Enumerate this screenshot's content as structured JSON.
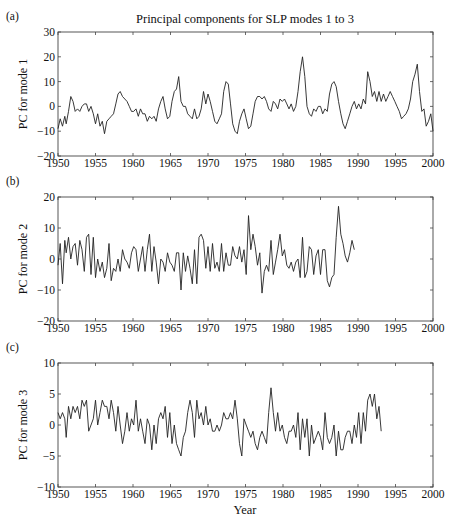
{
  "figure": {
    "title": "Principal components for SLP modes 1 to 3",
    "xlabel": "Year"
  },
  "chart_data": [
    {
      "type": "line",
      "panel_label": "(a)",
      "title": "Principal components for SLP modes 1 to 3",
      "xlabel": "",
      "ylabel": "PC for mode 1",
      "xlim": [
        1950,
        2000
      ],
      "ylim": [
        -20,
        30
      ],
      "xticks": [
        1950,
        1955,
        1960,
        1965,
        1970,
        1975,
        1980,
        1985,
        1990,
        1995,
        2000
      ],
      "yticks": [
        -20,
        -10,
        0,
        10,
        20,
        30
      ],
      "grid": false,
      "series": [
        {
          "name": "PC1",
          "x": [
            1950.0,
            1950.3,
            1950.6,
            1950.9,
            1951.1,
            1951.4,
            1951.7,
            1952.0,
            1952.3,
            1952.6,
            1952.9,
            1953.2,
            1953.5,
            1953.8,
            1954.1,
            1954.4,
            1954.7,
            1955.0,
            1955.3,
            1955.6,
            1955.9,
            1956.2,
            1956.5,
            1956.8,
            1957.1,
            1957.4,
            1957.7,
            1958.0,
            1958.3,
            1958.6,
            1958.9,
            1959.2,
            1959.5,
            1959.8,
            1960.1,
            1960.4,
            1960.7,
            1961.0,
            1961.3,
            1961.6,
            1961.9,
            1962.2,
            1962.5,
            1962.8,
            1963.1,
            1963.4,
            1963.7,
            1964.0,
            1964.3,
            1964.6,
            1964.9,
            1965.2,
            1965.5,
            1965.8,
            1966.1,
            1966.4,
            1966.7,
            1967.0,
            1967.3,
            1967.6,
            1967.9,
            1968.2,
            1968.5,
            1968.8,
            1969.1,
            1969.4,
            1969.7,
            1970.0,
            1970.3,
            1970.6,
            1970.9,
            1971.2,
            1971.5,
            1971.8,
            1972.1,
            1972.4,
            1972.7,
            1973.0,
            1973.3,
            1973.6,
            1973.9,
            1974.2,
            1974.5,
            1974.8,
            1975.1,
            1975.4,
            1975.7,
            1976.0,
            1976.3,
            1976.6,
            1976.9,
            1977.2,
            1977.5,
            1977.8,
            1978.1,
            1978.4,
            1978.7,
            1979.0,
            1979.3,
            1979.6,
            1979.9,
            1980.2,
            1980.5,
            1980.8,
            1981.1,
            1981.4,
            1981.7,
            1982.0,
            1982.3,
            1982.6,
            1982.9,
            1983.2,
            1983.5,
            1983.8,
            1984.1,
            1984.4,
            1984.7,
            1985.0,
            1985.3,
            1985.6,
            1985.9,
            1986.2,
            1986.5,
            1986.8,
            1987.1,
            1987.4,
            1987.7,
            1988.0,
            1988.3,
            1988.6,
            1988.9,
            1989.2,
            1989.5,
            1989.8,
            1990.1,
            1990.4,
            1990.7,
            1991.0,
            1991.3,
            1991.6,
            1991.9,
            1992.2,
            1992.5,
            1992.8,
            1993.1,
            1993.4,
            1993.7,
            1994.0,
            1994.3,
            1994.6,
            1994.9,
            1995.2,
            1995.5,
            1995.8,
            1996.1,
            1996.4,
            1996.7,
            1997.0,
            1997.3,
            1997.6,
            1997.9,
            1998.2,
            1998.5,
            1998.8,
            1999.1,
            1999.4,
            1999.7,
            2000.0
          ],
          "values": [
            -9,
            -5,
            -8,
            -4,
            -7,
            -2,
            4,
            2,
            -2,
            -1,
            -2,
            0,
            1,
            1,
            -2,
            0,
            -3,
            -7,
            -3,
            -8,
            -6,
            -11,
            -6,
            -5,
            -4,
            -3,
            1,
            5,
            6,
            4,
            3,
            2,
            0,
            -2,
            -2,
            -1,
            -4,
            -1,
            -3,
            -3,
            -6,
            -4,
            -5,
            -4,
            -6,
            -1,
            2,
            4,
            -1,
            -5,
            -4,
            2,
            6,
            7,
            12,
            2,
            0,
            0,
            -3,
            -4,
            -5,
            -1,
            -5,
            -4,
            -1,
            6,
            1,
            5,
            2,
            -2,
            -6,
            -7,
            -5,
            -3,
            6,
            10,
            9,
            1,
            -7,
            -10,
            -11,
            -6,
            -3,
            -1,
            -5,
            -9,
            -8,
            -3,
            2,
            4,
            4,
            3,
            4,
            2,
            -1,
            -2,
            2,
            1,
            -1,
            3,
            2,
            3,
            1,
            -1,
            1,
            -2,
            0,
            6,
            14,
            20,
            12,
            0,
            -3,
            -4,
            -1,
            -2,
            0,
            0,
            -3,
            -1,
            -2,
            5,
            9,
            10,
            8,
            2,
            -3,
            -7,
            -9,
            -6,
            -3,
            0,
            2,
            -1,
            1,
            -1,
            3,
            1,
            14,
            10,
            4,
            6,
            2,
            6,
            2,
            5,
            2,
            4,
            6,
            4,
            2,
            0,
            -2,
            -5,
            -4,
            -3,
            -1,
            3,
            10,
            13,
            17,
            6,
            -2,
            -1,
            -8,
            -6,
            -3,
            -10
          ]
        }
      ]
    },
    {
      "type": "line",
      "panel_label": "(b)",
      "title": "",
      "xlabel": "",
      "ylabel": "PC for mode 2",
      "xlim": [
        1950,
        2000
      ],
      "ylim": [
        -20,
        20
      ],
      "xticks": [
        1950,
        1955,
        1960,
        1965,
        1970,
        1975,
        1980,
        1985,
        1990,
        1995,
        2000
      ],
      "yticks": [
        -20,
        -10,
        0,
        10,
        20
      ],
      "grid": false,
      "series": [
        {
          "name": "PC2",
          "x": [
            1950.0,
            1950.3,
            1950.6,
            1950.9,
            1951.1,
            1951.4,
            1951.7,
            1952.0,
            1952.3,
            1952.6,
            1952.9,
            1953.2,
            1953.5,
            1953.8,
            1954.1,
            1954.4,
            1954.7,
            1955.0,
            1955.3,
            1955.6,
            1955.9,
            1956.2,
            1956.5,
            1956.8,
            1957.1,
            1957.4,
            1957.7,
            1958.0,
            1958.3,
            1958.6,
            1958.9,
            1959.2,
            1959.5,
            1959.8,
            1960.1,
            1960.4,
            1960.7,
            1961.0,
            1961.3,
            1961.6,
            1961.9,
            1962.2,
            1962.5,
            1962.8,
            1963.1,
            1963.4,
            1963.7,
            1964.0,
            1964.3,
            1964.6,
            1964.9,
            1965.2,
            1965.5,
            1965.8,
            1966.1,
            1966.4,
            1966.7,
            1967.0,
            1967.3,
            1967.6,
            1967.9,
            1968.2,
            1968.5,
            1968.8,
            1969.1,
            1969.4,
            1969.7,
            1970.0,
            1970.3,
            1970.6,
            1970.9,
            1971.2,
            1971.5,
            1971.8,
            1972.1,
            1972.4,
            1972.7,
            1973.0,
            1973.3,
            1973.6,
            1973.9,
            1974.2,
            1974.5,
            1974.8,
            1975.1,
            1975.4,
            1975.7,
            1976.0,
            1976.3,
            1976.6,
            1976.9,
            1977.2,
            1977.5,
            1977.8,
            1978.1,
            1978.4,
            1978.7,
            1979.0,
            1979.3,
            1979.6,
            1979.9,
            1980.2,
            1980.5,
            1980.8,
            1981.1,
            1981.4,
            1981.7,
            1982.0,
            1982.3,
            1982.6,
            1982.9,
            1983.2,
            1983.5,
            1983.8,
            1984.1,
            1984.4,
            1984.7,
            1985.0,
            1985.3,
            1985.6,
            1985.9,
            1986.2,
            1986.5,
            1986.8,
            1987.1,
            1987.4,
            1987.7,
            1988.0,
            1988.3,
            1988.6,
            1988.9,
            1989.2,
            1989.5,
            1989.8,
            1990.1,
            1990.4,
            1990.7,
            1991.0,
            1991.3,
            1991.6,
            1991.9,
            1992.2,
            1992.5,
            1992.8,
            1993.1,
            1993.4,
            1993.7,
            1994.0,
            1994.3,
            1994.6,
            1994.9,
            1995.2,
            1995.5,
            1995.8,
            1996.1,
            1996.4,
            1996.7,
            1997.0,
            1997.3,
            1997.6,
            1997.9,
            1998.2,
            1998.5,
            1998.8,
            1999.1,
            1999.4,
            1999.7,
            2000.0
          ],
          "values": [
            -2,
            5,
            -8,
            6,
            2,
            7,
            0,
            4,
            5,
            -2,
            6,
            3,
            -4,
            7,
            8,
            -5,
            7,
            -6,
            0,
            -4,
            -1,
            -6,
            -3,
            5,
            -7,
            -3,
            -4,
            0,
            -4,
            3,
            0,
            -1,
            -3,
            2,
            4,
            3,
            -4,
            0,
            4,
            -4,
            3,
            8,
            -4,
            4,
            -1,
            -8,
            0,
            -1,
            -4,
            2,
            -1,
            -2,
            -4,
            2,
            2,
            -10,
            2,
            -4,
            1,
            -3,
            -8,
            3,
            -8,
            7,
            8,
            6,
            -3,
            4,
            -4,
            5,
            -3,
            -1,
            -4,
            5,
            -4,
            2,
            -2,
            -2,
            4,
            1,
            0,
            4,
            -1,
            3,
            -5,
            14,
            3,
            8,
            4,
            -2,
            2,
            -11,
            -4,
            -2,
            -4,
            6,
            -5,
            -1,
            3,
            8,
            1,
            3,
            -2,
            -3,
            -1,
            -4,
            -1,
            0,
            -6,
            7,
            -6,
            -4,
            4,
            3,
            -5,
            1,
            3,
            -5,
            3,
            3,
            -7,
            -9,
            -6,
            -5,
            7,
            17,
            8,
            5,
            1,
            -1,
            2,
            6,
            3
          ]
        }
      ]
    },
    {
      "type": "line",
      "panel_label": "(c)",
      "title": "",
      "xlabel": "Year",
      "ylabel": "PC for mode 3",
      "xlim": [
        1950,
        2000
      ],
      "ylim": [
        -10,
        10
      ],
      "xticks": [
        1950,
        1955,
        1960,
        1965,
        1970,
        1975,
        1980,
        1985,
        1990,
        1995,
        2000
      ],
      "yticks": [
        -10,
        -5,
        0,
        5,
        10
      ],
      "grid": false,
      "series": [
        {
          "name": "PC3",
          "x": [
            1950.0,
            1950.3,
            1950.6,
            1950.9,
            1951.1,
            1951.4,
            1951.7,
            1952.0,
            1952.3,
            1952.6,
            1952.9,
            1953.2,
            1953.5,
            1953.8,
            1954.1,
            1954.4,
            1954.7,
            1955.0,
            1955.3,
            1955.6,
            1955.9,
            1956.2,
            1956.5,
            1956.8,
            1957.1,
            1957.4,
            1957.7,
            1958.0,
            1958.3,
            1958.6,
            1958.9,
            1959.2,
            1959.5,
            1959.8,
            1960.1,
            1960.4,
            1960.7,
            1961.0,
            1961.3,
            1961.6,
            1961.9,
            1962.2,
            1962.5,
            1962.8,
            1963.1,
            1963.4,
            1963.7,
            1964.0,
            1964.3,
            1964.6,
            1964.9,
            1965.2,
            1965.5,
            1965.8,
            1966.1,
            1966.4,
            1966.7,
            1967.0,
            1967.3,
            1967.6,
            1967.9,
            1968.2,
            1968.5,
            1968.8,
            1969.1,
            1969.4,
            1969.7,
            1970.0,
            1970.3,
            1970.6,
            1970.9,
            1971.2,
            1971.5,
            1971.8,
            1972.1,
            1972.4,
            1972.7,
            1973.0,
            1973.3,
            1973.6,
            1973.9,
            1974.2,
            1974.5,
            1974.8,
            1975.1,
            1975.4,
            1975.7,
            1976.0,
            1976.3,
            1976.6,
            1976.9,
            1977.2,
            1977.5,
            1977.8,
            1978.1,
            1978.4,
            1978.7,
            1979.0,
            1979.3,
            1979.6,
            1979.9,
            1980.2,
            1980.5,
            1980.8,
            1981.1,
            1981.4,
            1981.7,
            1982.0,
            1982.3,
            1982.6,
            1982.9,
            1983.2,
            1983.5,
            1983.8,
            1984.1,
            1984.4,
            1984.7,
            1985.0,
            1985.3,
            1985.6,
            1985.9,
            1986.2,
            1986.5,
            1986.8,
            1987.1,
            1987.4,
            1987.7,
            1988.0,
            1988.3,
            1988.6,
            1988.9,
            1989.2,
            1989.5,
            1989.8,
            1990.1,
            1990.4,
            1990.7,
            1991.0,
            1991.3,
            1991.6,
            1991.9,
            1992.2,
            1992.5,
            1992.8,
            1993.1,
            1993.4,
            1993.7,
            1994.0,
            1994.3,
            1994.6,
            1994.9,
            1995.2,
            1995.5,
            1995.8,
            1996.1,
            1996.4,
            1996.7,
            1997.0,
            1997.3,
            1997.6,
            1997.9,
            1998.2,
            1998.5,
            1998.8,
            1999.1,
            1999.4,
            1999.7,
            2000.0
          ],
          "values": [
            2,
            1,
            2,
            1,
            -2,
            3,
            1,
            3,
            2,
            3,
            1,
            4,
            3,
            4,
            -1,
            0,
            1,
            4,
            0,
            2,
            4,
            3,
            3,
            1,
            4,
            2,
            -1,
            3,
            0,
            -3,
            -1,
            2,
            -1,
            1,
            0,
            4,
            -1,
            1,
            -1,
            -3,
            1,
            0,
            -4,
            0,
            -3,
            1,
            2,
            1,
            3,
            -2,
            2,
            -3,
            0,
            -3,
            -4,
            -5,
            -2,
            -1,
            2,
            4,
            2,
            -2,
            4,
            1,
            2,
            0,
            3,
            0,
            1,
            -1,
            -1,
            0,
            -1,
            0,
            2,
            1,
            1,
            2,
            1,
            4,
            1,
            -3,
            -5,
            1,
            0,
            -1,
            -2,
            -1,
            -3,
            -4,
            -2,
            -1,
            -2,
            -3,
            2,
            6,
            2,
            -1,
            2,
            -1,
            0,
            -2,
            -3,
            -1,
            -1,
            0,
            -2,
            2,
            -4,
            1,
            -2,
            1,
            -5,
            0,
            -3,
            -2,
            -1,
            -2,
            -4,
            2,
            -2,
            -3,
            -2,
            0,
            -5,
            -1,
            -4,
            -4,
            -2,
            -1,
            -1,
            -3,
            0,
            -2,
            2,
            -3,
            2,
            -1,
            4,
            5,
            3,
            5,
            1,
            3,
            -1
          ]
        }
      ]
    }
  ]
}
